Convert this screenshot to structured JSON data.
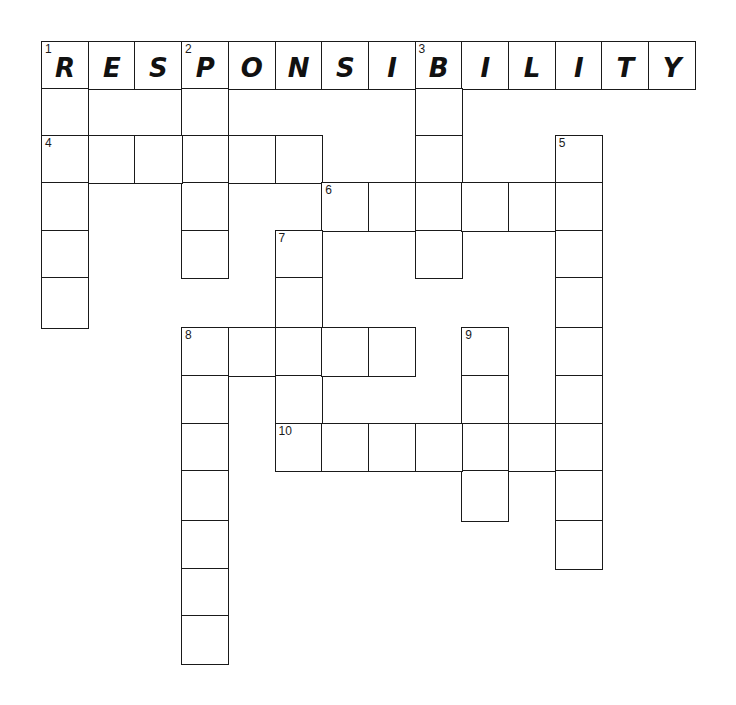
{
  "puzzle": {
    "type": "crossword",
    "origin_x": 41,
    "col_width": 46.7,
    "row_tops": [
      41,
      88,
      135,
      182,
      230,
      277,
      327,
      375,
      423,
      470,
      520,
      568,
      615,
      663
    ],
    "entries": [
      {
        "number": 1,
        "direction": "across",
        "row": 0,
        "col": 0,
        "length": 14,
        "answer": "RESPONSIBILITY"
      },
      {
        "number": 1,
        "direction": "down",
        "row": 0,
        "col": 0,
        "length": 6,
        "answer": ""
      },
      {
        "number": 2,
        "direction": "down",
        "row": 0,
        "col": 3,
        "length": 5,
        "answer": ""
      },
      {
        "number": 3,
        "direction": "down",
        "row": 0,
        "col": 8,
        "length": 5,
        "answer": ""
      },
      {
        "number": 4,
        "direction": "across",
        "row": 2,
        "col": 0,
        "length": 6,
        "answer": ""
      },
      {
        "number": 5,
        "direction": "down",
        "row": 2,
        "col": 11,
        "length": 9,
        "answer": ""
      },
      {
        "number": 6,
        "direction": "across",
        "row": 3,
        "col": 6,
        "length": 6,
        "answer": ""
      },
      {
        "number": 7,
        "direction": "down",
        "row": 4,
        "col": 5,
        "length": 5,
        "answer": ""
      },
      {
        "number": 8,
        "direction": "across",
        "row": 6,
        "col": 3,
        "length": 5,
        "answer": ""
      },
      {
        "number": 8,
        "direction": "down",
        "row": 6,
        "col": 3,
        "length": 7,
        "answer": ""
      },
      {
        "number": 9,
        "direction": "down",
        "row": 6,
        "col": 9,
        "length": 4,
        "answer": ""
      },
      {
        "number": 10,
        "direction": "across",
        "row": 8,
        "col": 5,
        "length": 7,
        "answer": ""
      }
    ]
  }
}
